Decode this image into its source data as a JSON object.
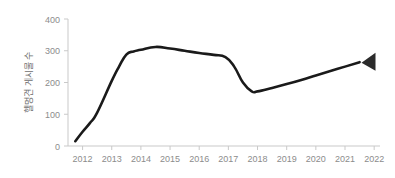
{
  "chart_data": {
    "type": "line",
    "title": "",
    "subtitle": "",
    "xlabel": "",
    "ylabel": "헬멍견 게시물 수",
    "xlim": [
      2011.5,
      2022.2
    ],
    "ylim": [
      0,
      400
    ],
    "ytick_labels": [
      "0",
      "100",
      "200",
      "300",
      "400"
    ],
    "ytick_values": [
      0,
      100,
      200,
      300,
      400
    ],
    "xtick_labels": [
      "2012",
      "2013",
      "2014",
      "2015",
      "2016",
      "2017",
      "2018",
      "2019",
      "2020",
      "2021",
      "2022"
    ],
    "xtick_values": [
      2012,
      2013,
      2014,
      2015,
      2016,
      2017,
      2018,
      2019,
      2020,
      2021,
      2022
    ],
    "grid": false,
    "legend": "none",
    "series": [
      {
        "name": "헬멍견 게시물 수",
        "color": "#1a1a1a",
        "x": [
          2011.75,
          2012.0,
          2012.25,
          2012.5,
          2013.0,
          2013.25,
          2013.5,
          2013.75,
          2014.0,
          2014.5,
          2015.0,
          2015.5,
          2016.0,
          2016.5,
          2016.9,
          2017.2,
          2017.5,
          2017.8,
          2018.0,
          2018.5,
          2019.0,
          2019.5,
          2020.0,
          2020.5,
          2021.0,
          2021.5
        ],
        "values": [
          15,
          45,
          72,
          105,
          205,
          250,
          288,
          298,
          303,
          312,
          307,
          300,
          293,
          287,
          280,
          250,
          200,
          172,
          172,
          183,
          195,
          208,
          222,
          236,
          250,
          264
        ]
      }
    ],
    "annotations": [
      {
        "name": "end-marker",
        "shape": "left-pointing-triangle",
        "x": 2021.6,
        "y": 265,
        "color": "#2b2b2b"
      }
    ],
    "axis_color": "#c9c9c9",
    "tick_label_color": "#8c8c8c",
    "axis_title_color": "#6e6e6e",
    "background": "#ffffff"
  }
}
